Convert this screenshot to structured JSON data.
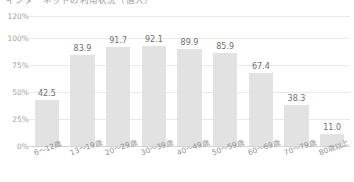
{
  "chart_title": "インターネットの利用状況（個人）",
  "chart_data": {
    "type": "bar",
    "title": "インターネットの利用状況（個人）",
    "xlabel": "",
    "ylabel": "",
    "categories": [
      "6〜12歳",
      "13〜19歳",
      "20〜29歳",
      "30〜39歳",
      "40〜49歳",
      "50〜59歳",
      "60〜69歳",
      "70〜79歳",
      "80歳以上"
    ],
    "values": [
      42.5,
      83.9,
      91.7,
      92.1,
      89.9,
      85.9,
      67.4,
      38.3,
      11.0
    ],
    "value_labels": [
      "42.5",
      "83.9",
      "91.7",
      "92.1",
      "89.9",
      "85.9",
      "67.4",
      "38.3",
      "11.0"
    ],
    "ylim": [
      0,
      120
    ],
    "yticks": [
      0,
      25,
      50,
      75,
      100,
      120
    ],
    "ytick_labels": [
      "0%",
      "25%",
      "50%",
      "75%",
      "100%",
      "120%"
    ],
    "grid": true,
    "legend": false,
    "bar_color": "#e2e2e2",
    "grid_color": "#e9e9e9",
    "axis_color": "#d2d2d2",
    "label_color": "#8f8f8f",
    "value_color": "#6e6e6e"
  }
}
